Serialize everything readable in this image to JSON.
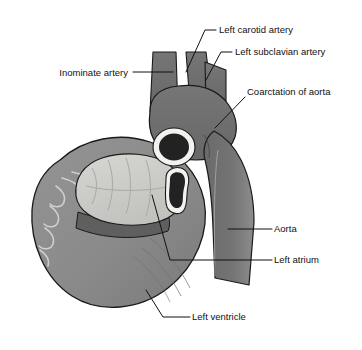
{
  "figure": {
    "background_color": "#ffffff",
    "width": 362,
    "height": 350
  },
  "palette": {
    "background": "#ffffff",
    "arch_gray": "#6e6e6e",
    "vessel_gray": "#787878",
    "ventricle_gray": "#8a8a8a",
    "ventricle_gray_dark": "#7c7c7c",
    "appendage_light": "#c8c8c4",
    "appendage_light2": "#d2d2ce",
    "vessel_lumen_dark": "#222222",
    "lumen_rim": "#f2f2ef",
    "outline": "#1a1a1a",
    "leader_line": "#111111",
    "label_text": "#111111",
    "coronary_light": "#cfcfcb"
  },
  "labels": [
    {
      "id": "innominate",
      "text": "Inominate artery",
      "anchor": "end",
      "x": 128,
      "y": 76
    },
    {
      "id": "carotid",
      "text": "Left carotid artery",
      "anchor": "start",
      "x": 219,
      "y": 33
    },
    {
      "id": "subclavian",
      "text": "Left subclavian artery",
      "anchor": "start",
      "x": 235,
      "y": 55
    },
    {
      "id": "coarctation",
      "text": "Coarctation of aorta",
      "anchor": "start",
      "x": 247,
      "y": 95
    },
    {
      "id": "aorta",
      "text": "Aorta",
      "anchor": "start",
      "x": 274,
      "y": 232
    },
    {
      "id": "left-atrium",
      "text": "Left atrium",
      "anchor": "start",
      "x": 274,
      "y": 263
    },
    {
      "id": "ventricle",
      "text": "Left ventricle",
      "anchor": "start",
      "x": 192,
      "y": 320
    }
  ],
  "leader_lines": [
    {
      "id": "innominate",
      "points": "133,72 173,72"
    },
    {
      "id": "carotid",
      "points": "216,30 205,30 186,72"
    },
    {
      "id": "subclavian",
      "points": "232,52 221,52 206,80"
    },
    {
      "id": "coarctation",
      "points": "245,97 215,128"
    },
    {
      "id": "aorta",
      "points": "272,229 228,229"
    },
    {
      "id": "left-atrium",
      "points": "272,260 170,260 152,195"
    },
    {
      "id": "ventricle",
      "points": "190,317 163,317 146,290"
    }
  ],
  "structures": [
    {
      "id": "aortic-arch",
      "name": "aortic arch"
    },
    {
      "id": "innominate-artery",
      "name": "innominate artery"
    },
    {
      "id": "left-carotid-artery",
      "name": "left carotid artery"
    },
    {
      "id": "left-subclavian-artery",
      "name": "left subclavian artery"
    },
    {
      "id": "descending-aorta",
      "name": "descending aorta"
    },
    {
      "id": "coarctation-narrowing",
      "name": "coarctation narrowing"
    },
    {
      "id": "left-ventricle",
      "name": "left ventricle"
    },
    {
      "id": "left-atrial-appendage",
      "name": "left atrial appendage"
    },
    {
      "id": "pulmonary-vein-upper",
      "name": "upper vessel cross-section"
    },
    {
      "id": "pulmonary-vein-lower",
      "name": "lower vessel cross-section"
    },
    {
      "id": "coronary-vessels",
      "name": "coronary vessels"
    }
  ]
}
